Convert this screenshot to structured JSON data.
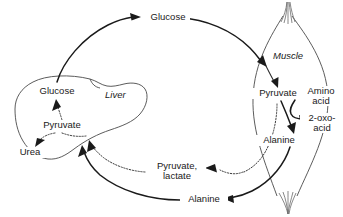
{
  "diagram": {
    "background_color": "#ffffff",
    "line_color": "#1a1a1a",
    "organ_outline_color": "#4a4a4a",
    "organs": [
      {
        "id": "liver",
        "label": "Liver"
      },
      {
        "id": "muscle",
        "label": "Muscle"
      }
    ],
    "metabolites": {
      "top_glucose": "Glucose",
      "liver_glucose": "Glucose",
      "liver_pyruvate": "Pyruvate",
      "liver_urea": "Urea",
      "muscle_pyruvate": "Pyruvate",
      "muscle_alanine": "Alanine",
      "amino_acid_line1": "Amino",
      "amino_acid_line2": "acid",
      "oxo_acid_line1": "2-oxo-",
      "oxo_acid_line2": "acid",
      "bottom_pyruvate_lactate_line1": "Pyruvate,",
      "bottom_pyruvate_lactate_line2": "lactate",
      "bottom_alanine": "Alanine"
    },
    "flows": [
      {
        "id": "liver-glucose-to-blood",
        "from": "Glucose (liver)",
        "to": "Glucose (blood)",
        "style": "solid"
      },
      {
        "id": "blood-glucose-to-muscle",
        "from": "Glucose (blood)",
        "to": "Muscle",
        "style": "solid"
      },
      {
        "id": "muscle-glucose-to-pyruvate",
        "from": "Glucose",
        "to": "Pyruvate (muscle)",
        "style": "thin"
      },
      {
        "id": "transamination-pyruvate-to-alanine",
        "from": "Pyruvate",
        "to": "Alanine",
        "style": "solid"
      },
      {
        "id": "transamination-amino-to-oxo",
        "from": "Amino acid",
        "to": "2-oxo-acid",
        "style": "solid"
      },
      {
        "id": "muscle-alanine-to-blood",
        "from": "Alanine (muscle)",
        "to": "Alanine (blood)",
        "style": "solid"
      },
      {
        "id": "blood-alanine-to-liver",
        "from": "Alanine (blood)",
        "to": "Pyruvate (liver)",
        "style": "solid"
      },
      {
        "id": "muscle-pyruvate-lactate-to-blood",
        "from": "Pyruvate, lactate (muscle)",
        "to": "blood",
        "style": "dotted"
      },
      {
        "id": "blood-pyruvate-lactate-to-liver",
        "from": "Pyruvate, lactate (blood)",
        "to": "Pyruvate (liver)",
        "style": "dotted"
      },
      {
        "id": "liver-pyruvate-to-glucose",
        "from": "Pyruvate (liver)",
        "to": "Glucose (liver)",
        "style": "dotted"
      },
      {
        "id": "liver-pyruvate-to-urea",
        "from": "Pyruvate (liver)",
        "to": "Urea",
        "style": "dotted"
      }
    ]
  }
}
